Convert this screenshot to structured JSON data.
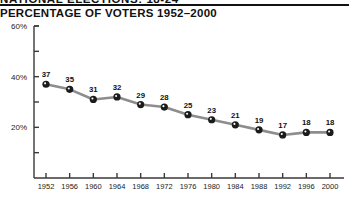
{
  "header": {
    "kicker": "NATIONAL ELECTIONS: 18-24",
    "title": "PERCENTAGE OF VOTERS 1952–2000"
  },
  "chart_data": {
    "type": "line",
    "title": "PERCENTAGE OF VOTERS 1952–2000",
    "xlabel": "",
    "ylabel": "",
    "grid": false,
    "legend": false,
    "ylim": [
      0,
      60
    ],
    "y_ticks_labeled": [
      "20%",
      "40%",
      "60%"
    ],
    "y_tick_values_labeled": [
      20,
      40,
      60
    ],
    "y_tick_values_minor": [
      10,
      30,
      50
    ],
    "categories": [
      "1952",
      "1956",
      "1960",
      "1964",
      "1968",
      "1972",
      "1976",
      "1980",
      "1984",
      "1988",
      "1992",
      "1996",
      "2000"
    ],
    "values": [
      37,
      35,
      31,
      32,
      29,
      28,
      25,
      23,
      21,
      19,
      17,
      18,
      18
    ],
    "point_labels": [
      "37",
      "35",
      "31",
      "32",
      "29",
      "28",
      "25",
      "23",
      "21",
      "19",
      "17",
      "18",
      "18"
    ],
    "colors": {
      "line": "#8d8d8d",
      "marker": "#1b1b1b",
      "axis": "#3a3a3a",
      "text": "#111111",
      "background": "#ffffff"
    }
  }
}
